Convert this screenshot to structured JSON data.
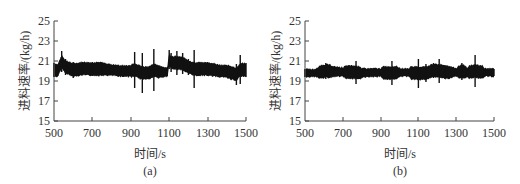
{
  "chart_data": [
    {
      "type": "line",
      "panel_label": "(a)",
      "title": "",
      "xlabel": "时间/s",
      "ylabel": "进料速率/(kg/h)",
      "xlim": [
        500,
        1500
      ],
      "ylim": [
        15,
        25
      ],
      "xticks": [
        500,
        700,
        900,
        1100,
        1300,
        1500
      ],
      "yticks": [
        15,
        17,
        19,
        21,
        23,
        25
      ],
      "grid": false,
      "legend": null,
      "description": "Noisy feed rate signal around ~20 kg/h; step disturbance near t=540 and t=1100 rising to ~22 then decaying; spikes near 920, 960, 1020, 1230",
      "x": [
        500,
        520,
        540,
        560,
        600,
        650,
        700,
        750,
        800,
        850,
        900,
        920,
        960,
        1000,
        1020,
        1050,
        1090,
        1100,
        1110,
        1140,
        1170,
        1200,
        1230,
        1260,
        1300,
        1350,
        1400,
        1450,
        1470,
        1500
      ],
      "series": [
        {
          "name": "upper envelope",
          "values": [
            20.8,
            20.6,
            22.0,
            21.2,
            20.9,
            20.9,
            20.9,
            20.8,
            20.6,
            20.5,
            20.5,
            21.9,
            21.8,
            20.4,
            22.2,
            20.4,
            20.3,
            22.1,
            21.8,
            22.0,
            21.8,
            21.2,
            22.1,
            20.9,
            20.9,
            20.6,
            20.5,
            20.7,
            21.6,
            20.8
          ]
        },
        {
          "name": "lower envelope",
          "values": [
            19.4,
            19.5,
            19.9,
            19.6,
            19.3,
            19.6,
            19.5,
            19.6,
            19.6,
            19.5,
            19.5,
            18.3,
            17.8,
            19.3,
            18.0,
            19.4,
            19.5,
            20.2,
            19.9,
            19.6,
            19.7,
            19.6,
            18.3,
            19.5,
            19.5,
            19.5,
            19.4,
            18.6,
            18.7,
            19.4
          ]
        }
      ]
    },
    {
      "type": "line",
      "panel_label": "(b)",
      "title": "",
      "xlabel": "时间/s",
      "ylabel": "进料速率/(kg/h)",
      "xlim": [
        500,
        1500
      ],
      "ylim": [
        15,
        25
      ],
      "xticks": [
        500,
        700,
        900,
        1100,
        1300,
        1500
      ],
      "yticks": [
        15,
        17,
        19,
        21,
        23,
        25
      ],
      "grid": false,
      "legend": null,
      "description": "Stable feed rate around ~19.8 kg/h with small spikes near 610, 770, 960, 1100, 1140, 1210, 1330, 1400",
      "x": [
        500,
        550,
        610,
        650,
        700,
        770,
        800,
        900,
        960,
        1000,
        1050,
        1100,
        1140,
        1180,
        1210,
        1240,
        1300,
        1330,
        1360,
        1400,
        1450,
        1500
      ],
      "series": [
        {
          "name": "upper envelope",
          "values": [
            20.2,
            20.1,
            20.8,
            20.4,
            20.3,
            21.0,
            20.2,
            20.2,
            21.0,
            20.2,
            20.2,
            21.2,
            20.7,
            20.8,
            21.2,
            20.6,
            20.2,
            20.8,
            20.2,
            21.6,
            20.2,
            20.2
          ]
        },
        {
          "name": "lower envelope",
          "values": [
            19.4,
            19.5,
            19.2,
            19.5,
            19.5,
            18.7,
            19.4,
            19.5,
            18.6,
            19.5,
            19.5,
            18.3,
            18.9,
            19.3,
            18.8,
            19.2,
            19.5,
            19.1,
            19.5,
            18.4,
            19.5,
            19.5
          ]
        }
      ]
    }
  ],
  "panels": [
    {
      "label": "(a)",
      "xlabel": "时间/s",
      "ylabel": "进料速率/(kg/h)",
      "xticks": [
        "500",
        "700",
        "900",
        "1100",
        "1300",
        "1500"
      ],
      "yticks": [
        "15",
        "17",
        "19",
        "21",
        "23",
        "25"
      ]
    },
    {
      "label": "(b)",
      "xlabel": "时间/s",
      "ylabel": "进料速率/(kg/h)",
      "xticks": [
        "500",
        "700",
        "900",
        "1100",
        "1300",
        "1500"
      ],
      "yticks": [
        "15",
        "17",
        "19",
        "21",
        "23",
        "25"
      ]
    }
  ]
}
